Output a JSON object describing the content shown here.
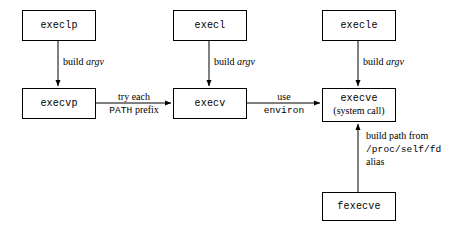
{
  "diagram": {
    "background_color": "#ffffff",
    "stroke_color": "#000000",
    "nodes": [
      {
        "id": "execlp",
        "label": "execlp",
        "sublabel": "",
        "x": 22,
        "y": 10,
        "w": 74,
        "h": 31
      },
      {
        "id": "execl",
        "label": "execl",
        "sublabel": "",
        "x": 173,
        "y": 10,
        "w": 74,
        "h": 31
      },
      {
        "id": "execle",
        "label": "execle",
        "sublabel": "",
        "x": 322,
        "y": 10,
        "w": 74,
        "h": 31
      },
      {
        "id": "execvp",
        "label": "execvp",
        "sublabel": "",
        "x": 22,
        "y": 88,
        "w": 74,
        "h": 31
      },
      {
        "id": "execv",
        "label": "execv",
        "sublabel": "",
        "x": 173,
        "y": 88,
        "w": 74,
        "h": 31
      },
      {
        "id": "execve",
        "label": "execve",
        "sublabel": "(system call)",
        "x": 322,
        "y": 88,
        "w": 74,
        "h": 34
      },
      {
        "id": "fexecve",
        "label": "fexecve",
        "sublabel": "",
        "x": 322,
        "y": 192,
        "w": 74,
        "h": 29
      }
    ],
    "edges": [
      {
        "id": "execlp-to-execvp",
        "from": "execlp",
        "to": "execvp",
        "direction": "down",
        "label_lines": [
          [
            {
              "text": "build ",
              "style": "roman"
            },
            {
              "text": "argv",
              "style": "italic"
            }
          ]
        ],
        "label_x": 63,
        "label_y": 56,
        "label_align": "left"
      },
      {
        "id": "execl-to-execv",
        "from": "execl",
        "to": "execv",
        "direction": "down",
        "label_lines": [
          [
            {
              "text": "build ",
              "style": "roman"
            },
            {
              "text": "argv",
              "style": "italic"
            }
          ]
        ],
        "label_x": 214,
        "label_y": 56,
        "label_align": "left"
      },
      {
        "id": "execle-to-execve",
        "from": "execle",
        "to": "execve",
        "direction": "down",
        "label_lines": [
          [
            {
              "text": "build ",
              "style": "roman"
            },
            {
              "text": "argv",
              "style": "italic"
            }
          ]
        ],
        "label_x": 363,
        "label_y": 56,
        "label_align": "left"
      },
      {
        "id": "execvp-to-execv",
        "from": "execvp",
        "to": "execv",
        "direction": "right",
        "label_lines": [
          [
            {
              "text": "try each",
              "style": "roman"
            }
          ],
          [
            {
              "text": "PATH",
              "style": "mono"
            },
            {
              "text": " prefix",
              "style": "roman"
            }
          ]
        ],
        "label_x": 134,
        "label_y": 91,
        "label_align": "center"
      },
      {
        "id": "execv-to-execve",
        "from": "execv",
        "to": "execve",
        "direction": "right",
        "label_lines": [
          [
            {
              "text": "use",
              "style": "roman"
            }
          ],
          [
            {
              "text": "environ",
              "style": "mono"
            }
          ]
        ],
        "label_x": 285,
        "label_y": 91,
        "label_align": "center"
      },
      {
        "id": "fexecve-to-execve",
        "from": "fexecve",
        "to": "execve",
        "direction": "up",
        "label_lines": [
          [
            {
              "text": "build path from",
              "style": "roman"
            }
          ],
          [
            {
              "text": "/proc/self/fd",
              "style": "mono"
            }
          ],
          [
            {
              "text": "alias",
              "style": "roman"
            }
          ]
        ],
        "label_x": 366,
        "label_y": 130,
        "label_align": "left"
      }
    ]
  }
}
